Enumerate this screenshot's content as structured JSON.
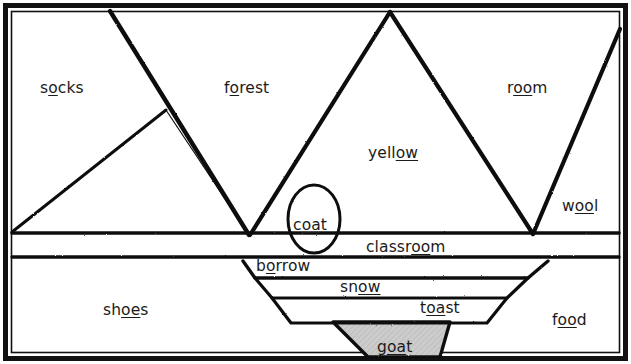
{
  "figure": {
    "type": "phonics-word-diagram",
    "background_color": "#ffffff",
    "ink_color": "#141414",
    "fill_color": "#cccccc",
    "border": "double-black-rectangle"
  },
  "words": [
    {
      "name": "socks",
      "text": "socks",
      "pre": "s",
      "underlined": "o",
      "post": "cks",
      "x": 40,
      "y": 81
    },
    {
      "name": "forest",
      "text": "forest",
      "pre": "f",
      "underlined": "o",
      "post": "rest",
      "x": 224,
      "y": 81
    },
    {
      "name": "room",
      "text": "room",
      "pre": "r",
      "underlined": "oo",
      "post": "m",
      "x": 507,
      "y": 81
    },
    {
      "name": "yellow",
      "text": "yellow",
      "pre": "yell",
      "underlined": "ow",
      "post": "",
      "x": 368,
      "y": 146
    },
    {
      "name": "wool",
      "text": "wool",
      "pre": "w",
      "underlined": "oo",
      "post": "l",
      "x": 562,
      "y": 199
    },
    {
      "name": "coat",
      "text": "coat",
      "pre": "c",
      "underlined": "oa",
      "post": "t",
      "x": 293,
      "y": 218
    },
    {
      "name": "classroom",
      "text": "classroom",
      "pre": "classr",
      "underlined": "oo",
      "post": "m",
      "x": 366,
      "y": 240
    },
    {
      "name": "borrow",
      "text": "borrow",
      "pre": "b",
      "underlined": "o",
      "post": "rrow",
      "x": 256,
      "y": 259
    },
    {
      "name": "snow",
      "text": "snow",
      "pre": "sn",
      "underlined": "ow",
      "post": "",
      "x": 340,
      "y": 280
    },
    {
      "name": "toast",
      "text": "toast",
      "pre": "t",
      "underlined": "oa",
      "post": "st",
      "x": 420,
      "y": 301
    },
    {
      "name": "shoes",
      "text": "shoes",
      "pre": "sh",
      "underlined": "oe",
      "post": "s",
      "x": 103,
      "y": 303
    },
    {
      "name": "food",
      "text": "food",
      "pre": "f",
      "underlined": "oo",
      "post": "d",
      "x": 552,
      "y": 313
    },
    {
      "name": "goat",
      "text": "goat",
      "pre": "g",
      "underlined": "oa",
      "post": "t",
      "x": 377,
      "y": 340
    }
  ],
  "shapes": {
    "outer_frame": {
      "name": "outer-frame",
      "x": 5,
      "y": 5,
      "width": 621,
      "height": 354
    },
    "inner_frame": {
      "name": "inner-frame",
      "x": 11,
      "y": 11,
      "width": 609,
      "height": 342
    },
    "left_slope": {
      "name": "left-slope-line",
      "points": "12,232 165,110"
    },
    "left_peak": {
      "name": "left-peak-line",
      "points": "110,11 248,234"
    },
    "center_peak_left": {
      "name": "center-peak-left",
      "points": "249,234 390,11"
    },
    "center_peak_right": {
      "name": "center-peak-right",
      "points": "390,11 533,234"
    },
    "right_slope": {
      "name": "right-slope-line",
      "points": "533,234 620,28"
    },
    "ground_line_1": {
      "name": "ground-line-upper",
      "points": "12,233 620,233"
    },
    "ground_line_2": {
      "name": "ground-line-lower",
      "points": "12,256 620,256"
    },
    "coat_ellipse": {
      "name": "coat-ellipse",
      "cx": 314,
      "cy": 219,
      "rx": 25,
      "ry": 33
    },
    "trap_borrow": {
      "name": "trapezoid-borrow",
      "points": "243,261 548,261 528,277 255,277"
    },
    "trap_snow": {
      "name": "trapezoid-snow",
      "points": "255,277 528,277 507,297 272,297"
    },
    "trap_toast": {
      "name": "trapezoid-toast",
      "points": "272,297 507,297 487,322 290,322"
    },
    "tri_goat": {
      "name": "triangle-goat",
      "points": "333,322 450,322 440,357 368,357"
    }
  }
}
